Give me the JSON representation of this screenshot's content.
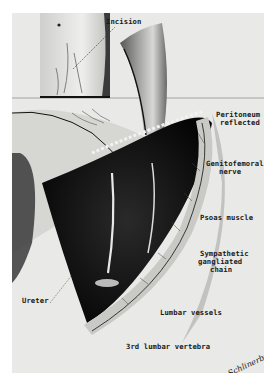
{
  "figure": {
    "colors": {
      "paper": "#ffffff",
      "plate_background": "#e9e9e7",
      "ink": "#1a1a1a"
    },
    "inset": {
      "label": "Incision"
    },
    "labels": {
      "peritoneum": [
        "Peritoneum",
        "reflected"
      ],
      "genitofemoral": [
        "Genitofemoral",
        "nerve"
      ],
      "psoas": "Psoas muscle",
      "sympathetic": [
        "Sympathetic",
        "gangliated",
        "chain"
      ],
      "ureter": "Ureter",
      "lumbar_vessels": "Lumbar vessels",
      "vertebra": "3rd lumbar vertebra"
    },
    "signature": "Schlinerbuch"
  }
}
